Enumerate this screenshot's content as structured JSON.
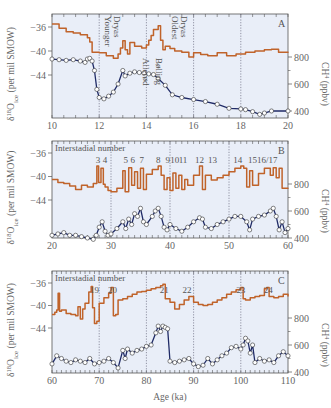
{
  "figure": {
    "xlabel": "Age (ka)",
    "left_ylabel": "δ18O_ice (per mil SMOW)",
    "right_ylabel": "CH4 (ppbv)",
    "colors": {
      "background": "#e9eef8",
      "d18o": "#c0632a",
      "ch4_line": "#1f2a66",
      "marker_fill": "#ffffff",
      "marker_edge": "#333333",
      "gridline": "#6a6a80"
    }
  },
  "chart_data": [
    {
      "panel": "A",
      "type": "line",
      "xlim": [
        10,
        20
      ],
      "xticks": [
        10,
        12,
        14,
        16,
        18,
        20
      ],
      "vlines": [
        12,
        14,
        16,
        18
      ],
      "left_yticks": [
        -36,
        -40,
        -44
      ],
      "right_yticks": [
        800,
        600,
        400
      ],
      "annotations": [
        "Younger Dryas",
        "Allerød",
        "Bølling",
        "Oldest Dryas"
      ],
      "series": [
        {
          "name": "δ18O_ice",
          "axis": "left",
          "x": [
            10,
            10.3,
            10.6,
            10.9,
            11.2,
            11.5,
            11.6,
            11.7,
            12.0,
            12.3,
            12.6,
            12.8,
            12.9,
            13.0,
            13.1,
            13.2,
            13.3,
            13.5,
            13.8,
            14.0,
            14.1,
            14.2,
            14.3,
            14.5,
            14.6,
            14.7,
            14.8,
            15.0,
            15.2,
            15.5,
            15.8,
            16.0,
            16.3,
            16.6,
            17.0,
            17.4,
            17.8,
            18.2,
            18.6,
            19.0,
            19.3,
            19.6,
            20
          ],
          "y": [
            -35.5,
            -36.2,
            -36.8,
            -37.0,
            -37.3,
            -37.8,
            -38.5,
            -40.2,
            -40.3,
            -40.8,
            -41.2,
            -40.5,
            -39.5,
            -38.3,
            -39.8,
            -40.5,
            -38.6,
            -39.2,
            -39.5,
            -39.0,
            -38.2,
            -37.4,
            -36.4,
            -35.8,
            -38.2,
            -39.8,
            -39.2,
            -39.6,
            -40.0,
            -40.2,
            -41.0,
            -40.3,
            -40.6,
            -40.8,
            -40.3,
            -40.8,
            -40.5,
            -40.2,
            -40.0,
            -39.8,
            -39.7,
            -40.2,
            -40.3
          ]
        },
        {
          "name": "CH4",
          "axis": "right",
          "x": [
            10,
            10.3,
            10.6,
            10.9,
            11.2,
            11.4,
            11.5,
            11.6,
            11.7,
            11.8,
            11.9,
            12.0,
            12.2,
            12.4,
            12.6,
            12.8,
            13.0,
            13.1,
            13.3,
            13.5,
            13.7,
            13.9,
            14.1,
            14.3,
            14.5,
            14.8,
            15.1,
            15.5,
            16.0,
            16.5,
            17.0,
            17.5,
            18.0,
            18.2,
            18.5,
            18.8,
            19.0,
            19.3,
            20
          ],
          "y": [
            785,
            780,
            775,
            780,
            770,
            760,
            785,
            790,
            770,
            700,
            560,
            500,
            490,
            510,
            540,
            600,
            700,
            660,
            680,
            690,
            685,
            680,
            675,
            670,
            640,
            590,
            520,
            500,
            485,
            470,
            450,
            420,
            415,
            410,
            395,
            375,
            385,
            400,
            400
          ]
        }
      ]
    },
    {
      "panel": "B",
      "type": "line",
      "xlim": [
        20,
        60
      ],
      "xticks": [
        20,
        30,
        40,
        50,
        60
      ],
      "vlines": [
        30,
        40,
        50
      ],
      "left_yticks": [
        -36,
        -40,
        -44
      ],
      "right_yticks": [
        800,
        600,
        400
      ],
      "header": "Interstadial number",
      "interstadials": [
        {
          "label": "3",
          "x": 27.8
        },
        {
          "label": "4",
          "x": 29.0
        },
        {
          "label": "5",
          "x": 32.5
        },
        {
          "label": "6",
          "x": 33.7
        },
        {
          "label": "7",
          "x": 35.2
        },
        {
          "label": "8",
          "x": 38.0
        },
        {
          "label": "9",
          "x": 39.6
        },
        {
          "label": "10",
          "x": 40.8
        },
        {
          "label": "11",
          "x": 42.2
        },
        {
          "label": "12",
          "x": 45.0
        },
        {
          "label": "13",
          "x": 47.2
        },
        {
          "label": "14",
          "x": 51.5
        },
        {
          "label": "15",
          "x": 54.0
        },
        {
          "label": "16/17",
          "x": 56.5
        }
      ],
      "series": [
        {
          "name": "δ18O_ice",
          "axis": "left",
          "x": [
            20,
            21,
            22,
            23,
            24,
            25,
            26,
            27,
            27.6,
            27.9,
            28.3,
            28.7,
            29.0,
            29.5,
            30,
            31,
            32,
            32.4,
            33,
            33.5,
            34,
            34.5,
            35,
            35.5,
            36,
            37,
            38,
            38.5,
            39,
            39.5,
            40,
            40.5,
            41,
            41.5,
            42,
            42.5,
            43,
            44,
            45,
            45.5,
            46,
            47,
            48,
            49,
            50,
            51,
            52,
            52.5,
            53,
            53.5,
            54,
            55,
            56,
            57,
            57.5,
            58,
            58.5,
            59,
            60
          ],
          "y": [
            -40.5,
            -41,
            -41.2,
            -41.6,
            -42.2,
            -41.5,
            -41.8,
            -41.2,
            -38.2,
            -41.0,
            -38.6,
            -41.3,
            -41.8,
            -42.4,
            -42.6,
            -42.0,
            -39.0,
            -42.6,
            -38.5,
            -41.5,
            -39.2,
            -42.0,
            -38.6,
            -42.2,
            -39.6,
            -38.8,
            -38.2,
            -39.8,
            -42.2,
            -40.2,
            -42.4,
            -39.4,
            -42.0,
            -39.8,
            -42.2,
            -40.5,
            -41.5,
            -39.8,
            -38.2,
            -42.2,
            -39.8,
            -40.6,
            -40.2,
            -39.8,
            -39.2,
            -38.6,
            -38.2,
            -38.6,
            -41.8,
            -39.0,
            -41.5,
            -39.5,
            -38.6,
            -39.8,
            -38.5,
            -40.2,
            -38.6,
            -42.0,
            -41.9
          ]
        },
        {
          "name": "CH4",
          "axis": "right",
          "x": [
            20,
            21,
            22,
            23,
            24,
            25,
            26,
            27,
            27.5,
            28,
            28.5,
            29,
            29.5,
            30,
            31,
            32,
            32.5,
            33,
            33.5,
            34,
            34.5,
            35,
            35.5,
            36,
            37,
            37.5,
            38,
            38.5,
            39,
            39.5,
            40,
            41,
            42,
            43,
            44,
            45,
            45.5,
            46,
            47,
            48,
            49,
            50,
            51,
            52,
            53,
            53.5,
            54,
            55,
            56,
            57,
            57.5,
            58,
            58.5,
            59,
            59.5,
            60
          ],
          "y": [
            420,
            430,
            440,
            420,
            420,
            410,
            400,
            390,
            420,
            480,
            520,
            450,
            420,
            430,
            470,
            520,
            470,
            540,
            500,
            580,
            560,
            620,
            520,
            500,
            560,
            600,
            620,
            560,
            480,
            460,
            500,
            470,
            450,
            480,
            520,
            550,
            540,
            480,
            470,
            500,
            520,
            540,
            560,
            560,
            520,
            460,
            540,
            560,
            570,
            600,
            620,
            560,
            460,
            520,
            440,
            470
          ]
        }
      ]
    },
    {
      "panel": "C",
      "type": "line",
      "xlim": [
        60,
        110
      ],
      "xticks": [
        60,
        70,
        80,
        90,
        100,
        110
      ],
      "vlines": [
        70,
        80,
        90,
        100
      ],
      "left_yticks": [
        -36,
        -40,
        -44
      ],
      "right_yticks": [
        800,
        600,
        400
      ],
      "header": "Interstadial number",
      "interstadials": [
        {
          "label": "19",
          "x": 69.0
        },
        {
          "label": "20",
          "x": 72.8
        },
        {
          "label": "21",
          "x": 83.8
        },
        {
          "label": "22",
          "x": 88.6
        },
        {
          "label": "23",
          "x": 100.0
        },
        {
          "label": "24",
          "x": 105.8
        }
      ],
      "series": [
        {
          "name": "δ18O_ice",
          "axis": "left",
          "x": [
            60,
            60.6,
            61,
            61.3,
            61.6,
            62,
            63,
            64,
            65,
            65.5,
            66,
            66.5,
            67,
            67.8,
            68.3,
            68.6,
            69,
            69.5,
            70,
            71,
            72,
            72.5,
            73,
            73.5,
            74,
            75,
            76,
            77,
            78,
            79,
            80,
            81,
            82,
            83,
            83.5,
            84,
            85,
            86,
            87,
            88,
            89,
            90,
            91,
            92,
            93,
            94,
            95,
            96,
            97,
            98,
            99,
            100,
            100.5,
            101,
            102,
            103,
            104,
            105,
            105.5,
            106,
            107,
            108,
            109,
            110
          ],
          "y": [
            -41.6,
            -41.2,
            -40.8,
            -37.8,
            -41.0,
            -40.8,
            -41.4,
            -41.6,
            -41.8,
            -40.2,
            -42.4,
            -40.6,
            -39.6,
            -37.6,
            -36.6,
            -40.4,
            -43.2,
            -42.8,
            -39.6,
            -38.6,
            -37.8,
            -36.8,
            -41.8,
            -41.6,
            -39.0,
            -38.8,
            -38.4,
            -38.0,
            -37.6,
            -37.5,
            -37.3,
            -37.0,
            -36.8,
            -36.5,
            -36.2,
            -38.8,
            -39.4,
            -40.6,
            -39.8,
            -39.0,
            -38.4,
            -39.4,
            -39.8,
            -40.0,
            -39.8,
            -39.4,
            -39.0,
            -38.6,
            -38.0,
            -37.6,
            -37.2,
            -36.8,
            -38.8,
            -39.0,
            -38.6,
            -38.4,
            -38.2,
            -37.0,
            -36.8,
            -38.4,
            -38.6,
            -38.4,
            -38.0,
            -38.4
          ]
        },
        {
          "name": "CH4",
          "axis": "right",
          "x": [
            60,
            61,
            62,
            63,
            64,
            65,
            66,
            67,
            68,
            69,
            70,
            71,
            72,
            73,
            74,
            75,
            75.5,
            76,
            77,
            78,
            79,
            80,
            81,
            82,
            82.5,
            83,
            83.5,
            84,
            84.5,
            85,
            86,
            87,
            88,
            89,
            90,
            91,
            92,
            93,
            94,
            95,
            96,
            97,
            98,
            99,
            100,
            100.5,
            101,
            101.5,
            102,
            102.5,
            103,
            104,
            105,
            106,
            107,
            108,
            109,
            110
          ],
          "y": [
            460,
            520,
            500,
            480,
            470,
            490,
            480,
            470,
            500,
            460,
            470,
            480,
            500,
            470,
            430,
            560,
            500,
            570,
            540,
            560,
            570,
            590,
            600,
            690,
            740,
            700,
            740,
            730,
            720,
            480,
            470,
            480,
            490,
            500,
            460,
            440,
            450,
            500,
            460,
            490,
            520,
            540,
            580,
            590,
            570,
            600,
            650,
            630,
            540,
            600,
            470,
            500,
            480,
            490,
            470,
            520,
            550,
            520
          ]
        }
      ]
    }
  ]
}
